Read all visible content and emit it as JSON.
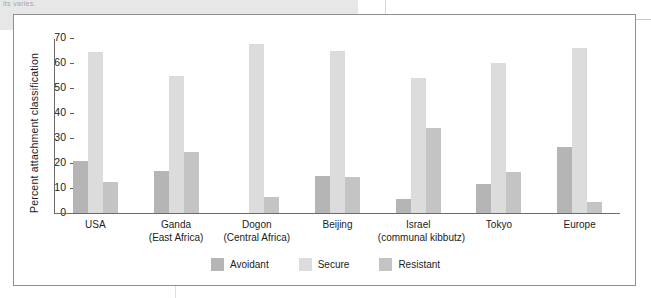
{
  "page_artifact": {
    "cut_text": "its varies."
  },
  "chart_data": {
    "type": "bar",
    "title": "",
    "xlabel": "",
    "ylabel": "Percent attachment classification",
    "ylim": [
      0,
      70
    ],
    "yticks": [
      0,
      10,
      20,
      30,
      40,
      50,
      60,
      70
    ],
    "ytick_labels": [
      "0",
      "10",
      "20",
      "30",
      "40",
      "50",
      "60",
      "70"
    ],
    "grid": false,
    "legend_position": "bottom-center",
    "categories": [
      "USA",
      "Ganda",
      "Dogon",
      "Beijing",
      "Israel",
      "Tokyo",
      "Europe"
    ],
    "category_sublabels": [
      "",
      "(East Africa)",
      "(Central Africa)",
      "",
      "(communal kibbutz)",
      "",
      ""
    ],
    "series": [
      {
        "name": "Avoidant",
        "color": "#b5b5b5",
        "values": [
          21,
          17,
          0,
          15,
          5.5,
          11.5,
          26.5
        ]
      },
      {
        "name": "Secure",
        "color": "#dcdcdc",
        "values": [
          64.5,
          55,
          67.5,
          65,
          54,
          60,
          66
        ]
      },
      {
        "name": "Resistant",
        "color": "#c4c4c4",
        "values": [
          12.5,
          24.5,
          6.5,
          14.5,
          34,
          16.5,
          4.5
        ]
      }
    ]
  }
}
